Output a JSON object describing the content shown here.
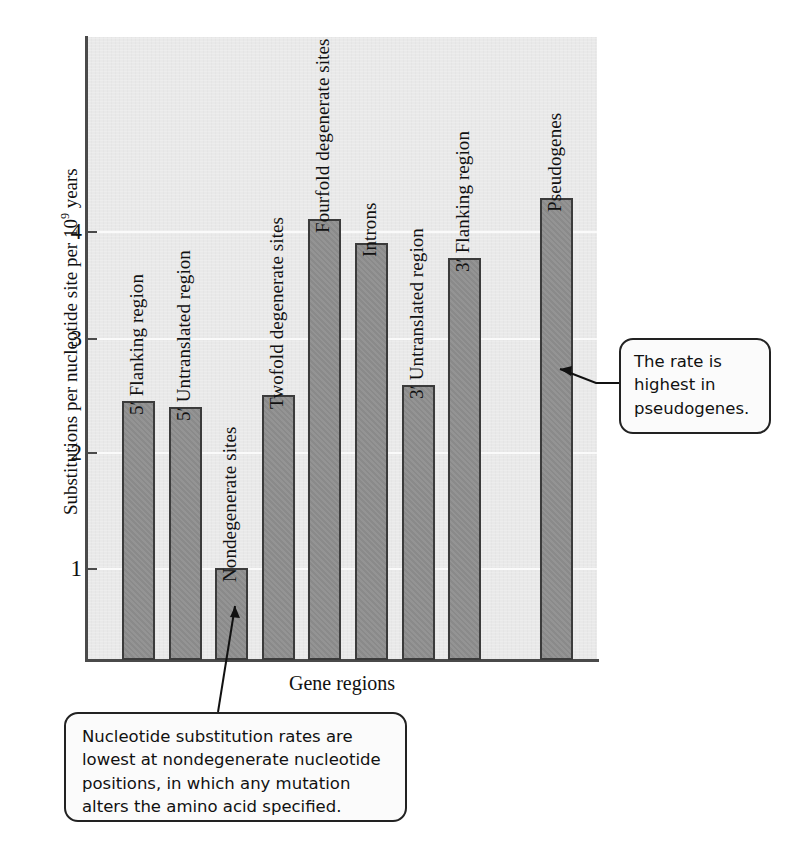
{
  "chart_data": {
    "type": "bar",
    "title": "",
    "xlabel": "Gene regions",
    "ylabel": "Substitutions per nucleotide site per 10⁹ years",
    "ylabel_prefix": "Substitutions per nucleotide site per 10",
    "ylabel_exponent": "9",
    "ylabel_suffix": " years",
    "ylim": [
      0,
      4.85
    ],
    "ytick_labels": [
      "1",
      "2",
      "3",
      "4"
    ],
    "ytick_values": [
      1,
      2,
      3,
      4
    ],
    "grid": "horizontal-white",
    "legend": "none",
    "categories": [
      "5ʹ Flanking region",
      "5ʹ Untranslated region",
      "Nondegenerate sites",
      "Twofold degenerate sites",
      "Fourfold degenerate sites",
      "Introns",
      "3ʹ Untranslated region",
      "3ʹ Flanking region",
      "Pseudogenes"
    ],
    "values": [
      2.02,
      1.97,
      0.72,
      2.06,
      3.43,
      3.25,
      2.14,
      3.13,
      3.6
    ],
    "bar_color": "#8e8e8e",
    "bar_border_color": "#3b3b3b",
    "plot_background": "#e9e9e9"
  },
  "annotations": [
    {
      "id": "pseudogenes-callout",
      "text": "The rate is highest in pseudogenes.",
      "lines": [
        "The rate is",
        "highest in",
        "pseudogenes."
      ],
      "points_to": "Pseudogenes"
    },
    {
      "id": "nondegenerate-callout",
      "text": "Nucleotide substitution rates are lowest at nondegenerate nucleotide positions, in which any mutation alters the amino acid specified.",
      "lines": [
        "Nucleotide substitution rates are",
        "lowest at nondegenerate nucleotide",
        "positions, in which any mutation",
        "alters the amino acid specified."
      ],
      "points_to": "Nondegenerate sites"
    }
  ]
}
